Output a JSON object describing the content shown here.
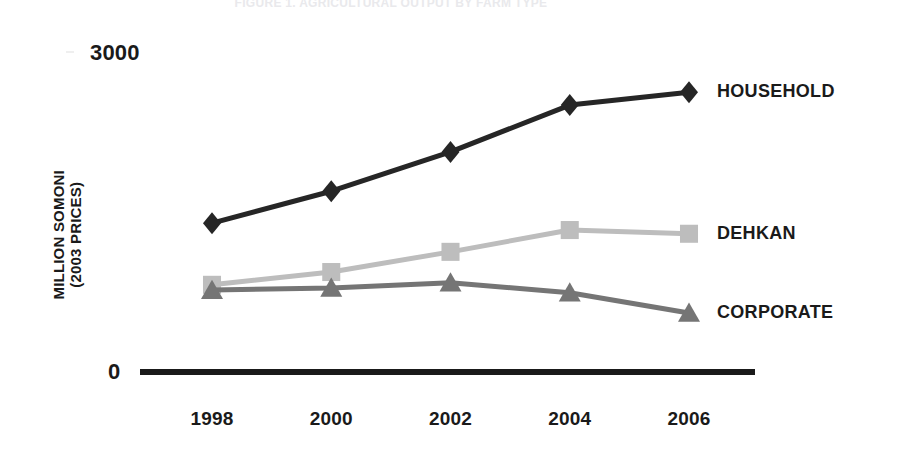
{
  "figure": {
    "cropped_title": "FIGURE 1.  AGRICULTURAL OUTPUT BY FARM TYPE",
    "y_axis_title_line1": "MILLION SOMONI",
    "y_axis_title_line2": "(2003 PRICES)",
    "y_max_label": "3000",
    "y_min_label": "0"
  },
  "chart_data": {
    "type": "line",
    "title": "",
    "xlabel": "",
    "ylabel": "MILLION SOMONI (2003 PRICES)",
    "categories": [
      "1998",
      "2000",
      "2002",
      "2004",
      "2006"
    ],
    "x": [
      1998,
      2000,
      2002,
      2004,
      2006
    ],
    "ylim": [
      0,
      3000
    ],
    "yticks": [
      0,
      3000
    ],
    "ytick_labels": [
      "0",
      "3000"
    ],
    "grid": false,
    "legend_position": "right-inline-end-of-line",
    "series": [
      {
        "name": "HOUSEHOLD",
        "marker": "diamond",
        "color": "#262626",
        "values": [
          1400,
          1700,
          2070,
          2510,
          2630
        ]
      },
      {
        "name": "DEHKAN",
        "marker": "square",
        "color": "#bdbdbd",
        "values": [
          820,
          940,
          1130,
          1335,
          1300
        ]
      },
      {
        "name": "CORPORATE",
        "marker": "triangle",
        "color": "#757575",
        "values": [
          770,
          790,
          840,
          745,
          555
        ]
      }
    ]
  },
  "colors": {
    "axis": "#1a1a1a",
    "household": "#262626",
    "dehkan": "#bdbdbd",
    "corporate": "#757575",
    "background": "#ffffff"
  }
}
